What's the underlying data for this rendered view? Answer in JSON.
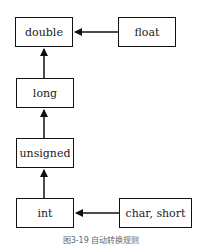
{
  "diagram": {
    "nodes": {
      "double": {
        "label": "double"
      },
      "float": {
        "label": "float"
      },
      "long": {
        "label": "long"
      },
      "unsigned": {
        "label": "unsigned"
      },
      "int": {
        "label": "int"
      },
      "char_short": {
        "label": "char, short"
      }
    },
    "edges": [
      {
        "from": "float",
        "to": "double"
      },
      {
        "from": "long",
        "to": "double"
      },
      {
        "from": "unsigned",
        "to": "long"
      },
      {
        "from": "int",
        "to": "unsigned"
      },
      {
        "from": "char_short",
        "to": "int"
      }
    ],
    "caption": "图3-19   自动转换规则"
  }
}
